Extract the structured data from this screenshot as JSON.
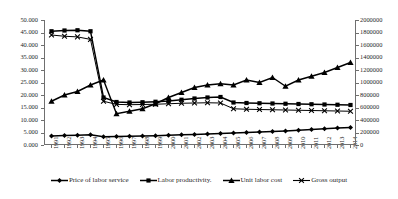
{
  "chart_data": {
    "type": "line",
    "title": "",
    "xlabel": "",
    "ylabel": "",
    "grid": false,
    "legend_position": "bottom",
    "categories": [
      "1991",
      "1992",
      "1993",
      "1994",
      "1995",
      "1996",
      "1997",
      "1998",
      "1999",
      "2000",
      "2001",
      "2002",
      "2003",
      "2004",
      "2005",
      "2006",
      "2007",
      "2008",
      "2009",
      "2010",
      "2011",
      "2012",
      "2013",
      "2014"
    ],
    "axes": {
      "left": {
        "min": 0,
        "max": 50,
        "step": 5,
        "ticks": [
          "0.000",
          "5.000",
          "10.000",
          "15.000",
          "20.000",
          "25.000",
          "30.000",
          "35.000",
          "40.000",
          "45.000",
          "50.000"
        ]
      },
      "right": {
        "min": 0,
        "max": 2000000,
        "step": 200000,
        "ticks": [
          "0",
          "200000",
          "400000",
          "600000",
          "800000",
          "1000000",
          "1200000",
          "1400000",
          "1600000",
          "1800000",
          "2000000"
        ]
      }
    },
    "series": [
      {
        "name": "Price of labor service",
        "marker": "diamond",
        "axis": "left",
        "values": [
          3.6,
          3.8,
          3.9,
          4.1,
          3.3,
          3.4,
          3.5,
          3.6,
          3.7,
          3.9,
          4.1,
          4.2,
          4.4,
          4.6,
          4.8,
          5.0,
          5.2,
          5.4,
          5.6,
          5.9,
          6.2,
          6.5,
          6.8,
          7.0
        ]
      },
      {
        "name": "Labor productivity.",
        "marker": "square",
        "axis": "left",
        "values": [
          45.5,
          45.8,
          45.9,
          45.5,
          19.0,
          17.2,
          17.0,
          17.1,
          17.3,
          17.6,
          18.1,
          18.6,
          19.0,
          19.2,
          17.0,
          16.8,
          16.7,
          16.6,
          16.5,
          16.4,
          16.3,
          16.2,
          16.1,
          16.0
        ]
      },
      {
        "name": "Unit labor cost",
        "marker": "triangle",
        "axis": "left",
        "values": [
          17.5,
          20.0,
          21.4,
          24.0,
          26.0,
          12.5,
          13.5,
          14.5,
          16.5,
          19.0,
          21.0,
          23.0,
          24.0,
          24.5,
          24.0,
          26.0,
          25.0,
          27.0,
          23.5,
          26.0,
          27.5,
          29.0,
          31.0,
          33.0
        ]
      },
      {
        "name": "Gross output",
        "marker": "cross",
        "axis": "right",
        "values": [
          1760000,
          1740000,
          1730000,
          1690000,
          700000,
          650000,
          645000,
          648000,
          652000,
          660000,
          668000,
          672000,
          676000,
          672000,
          580000,
          572000,
          568000,
          564000,
          560000,
          556000,
          552000,
          548000,
          544000,
          540000
        ]
      }
    ]
  },
  "legend": {
    "items": [
      {
        "label": "Price of labor service",
        "marker": "diamond"
      },
      {
        "label": "Labor productivity.",
        "marker": "square"
      },
      {
        "label": "Unit labor cost",
        "marker": "triangle"
      },
      {
        "label": "Gross output",
        "marker": "cross"
      }
    ]
  }
}
